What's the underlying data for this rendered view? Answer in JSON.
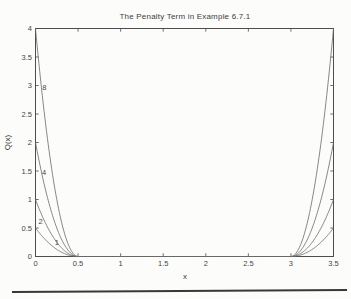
{
  "page": {
    "background": "#fcfcfb"
  },
  "chart_data": {
    "type": "line",
    "title": "The Penalty Term in Example 6.7.1",
    "xlabel": "x",
    "ylabel": "Q(x)",
    "xlim": [
      0,
      3.5
    ],
    "ylim": [
      0,
      4
    ],
    "xticks": [
      0,
      0.5,
      1,
      1.5,
      2,
      2.5,
      3,
      3.5
    ],
    "yticks": [
      0,
      0.5,
      1,
      1.5,
      2,
      2.5,
      3,
      3.5,
      4
    ],
    "grid": false,
    "box": true,
    "legend": null,
    "shape_note": "quadratic penalty curves, zero on the interval [0.5, 3], rising toward x=0 and x=3.5",
    "zero_interval": [
      0.5,
      3
    ],
    "series": [
      {
        "label": "1",
        "peak_value": 0.5
      },
      {
        "label": "2",
        "peak_value": 1
      },
      {
        "label": "4",
        "peak_value": 2
      },
      {
        "label": "8",
        "peak_value": 4
      }
    ],
    "curve_labels": [
      {
        "text": "8",
        "x": 0.105,
        "y": 2.96
      },
      {
        "text": "4",
        "x": 0.1,
        "y": 1.47
      },
      {
        "text": "2",
        "x": 0.06,
        "y": 0.62
      },
      {
        "text": "1",
        "x": 0.25,
        "y": 0.24
      }
    ],
    "colors": {
      "axis": "#4d4d4d",
      "curve": "#6a6a6a",
      "text": "#3d3d3d",
      "footer_rule": "#383838"
    }
  }
}
